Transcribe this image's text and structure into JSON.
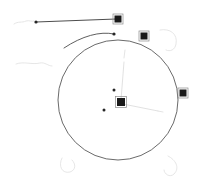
{
  "canvas": {
    "width": 205,
    "height": 196,
    "background_color": "#ffffff",
    "description": "Vector drawing canvas with a selected circle object and edit handles"
  },
  "colors": {
    "circle_stroke": "#595959",
    "line_stroke": "#4d4d4d",
    "handle_fill": "#1a1a1a",
    "handle_outline": "#8c8c8c",
    "point_fill": "#262626",
    "guide_stroke": "#d9d9d9",
    "faint_stroke": "#e0e0e0",
    "background": "#ffffff"
  },
  "shapes": {
    "circle": {
      "name": "main-circle",
      "cx": 118,
      "cy": 100,
      "r": 60,
      "stroke_width": 0.9,
      "filled": false
    },
    "top_chord_line": {
      "name": "top-horizontal-line",
      "x1": 36,
      "y1": 22,
      "x2": 116,
      "y2": 19,
      "stroke_width": 1.0
    },
    "inner_arc": {
      "name": "inner-arc-path",
      "path": "M 64 48 C 82 36 100 31 114 34",
      "stroke_width": 0.9
    }
  },
  "handles": [
    {
      "name": "handle-top",
      "x": 118,
      "y": 19,
      "size": 7,
      "type": "square",
      "selected": true
    },
    {
      "name": "handle-upper-right",
      "x": 144,
      "y": 36,
      "size": 7,
      "type": "square",
      "selected": true
    },
    {
      "name": "handle-right",
      "x": 183,
      "y": 93,
      "size": 7,
      "type": "square",
      "selected": true
    },
    {
      "name": "handle-center",
      "x": 121,
      "y": 102,
      "size": 8,
      "type": "square",
      "selected": true
    }
  ],
  "points": [
    {
      "name": "point-line-left-end",
      "x": 36,
      "y": 22,
      "r": 1.6
    },
    {
      "name": "point-arc-end",
      "x": 114,
      "y": 34,
      "r": 1.6
    },
    {
      "name": "point-upper-inner",
      "x": 114,
      "y": 90,
      "r": 1.5
    },
    {
      "name": "point-lower-left",
      "x": 104,
      "y": 110,
      "r": 1.5
    }
  ],
  "guides": [
    {
      "name": "guide-center-to-top",
      "path": "M 121 100 L 124 62",
      "stroke_width": 0.8
    },
    {
      "name": "guide-center-to-right",
      "path": "M 123 104 L 158 111",
      "stroke_width": 0.8
    },
    {
      "name": "guide-top-vertical-tick",
      "path": "M 124 58 L 125 50",
      "stroke_width": 0.7
    },
    {
      "name": "guide-right-tick",
      "path": "M 158 111 L 163 112",
      "stroke_width": 0.7
    }
  ],
  "faint_marks": [
    {
      "name": "faint-mark-left-upper",
      "path": "M 14 24 C 18 21 22 23 26 21 C 29 20 32 22 34 21",
      "stroke_width": 0.8
    },
    {
      "name": "faint-mark-left-middle",
      "path": "M 16 64 C 24 61 32 65 40 63 C 45 62 48 66 52 66",
      "stroke_width": 0.8
    },
    {
      "name": "faint-corner-top-right",
      "path": "M 160 30 C 170 28 178 34 176 44 C 175 50 170 52 166 50",
      "stroke_width": 0.8
    },
    {
      "name": "faint-corner-bottom-left",
      "path": "M 62 158 C 58 166 62 174 70 172 C 76 170 76 164 72 160",
      "stroke_width": 0.8
    },
    {
      "name": "faint-corner-bottom-right",
      "path": "M 168 156 C 176 160 180 168 174 174 C 170 178 164 174 164 170",
      "stroke_width": 0.8
    }
  ]
}
